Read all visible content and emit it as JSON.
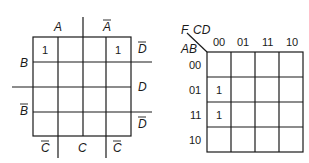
{
  "left_map": {
    "top_labels": [
      "A",
      "A"
    ],
    "top_labels_overbar": [
      false,
      true
    ],
    "right_labels": [
      "D",
      "D",
      "D"
    ],
    "right_labels_overbar": [
      true,
      false,
      true
    ],
    "left_labels": [
      "B",
      "B"
    ],
    "left_labels_overbar": [
      false,
      true
    ],
    "bottom_labels": [
      "C",
      "C",
      "C"
    ],
    "bottom_labels_overbar": [
      true,
      false,
      true
    ],
    "cells": [
      [
        "1",
        "",
        "",
        "1"
      ],
      [
        "",
        "",
        "",
        ""
      ],
      [
        "",
        "",
        "",
        ""
      ],
      [
        "",
        "",
        "",
        ""
      ]
    ]
  },
  "right_map": {
    "corner_output": "F",
    "corner_cols": "CD",
    "corner_rows": "AB",
    "col_headers": [
      "00",
      "01",
      "11",
      "10"
    ],
    "row_headers": [
      "00",
      "01",
      "11",
      "10"
    ],
    "cells": [
      [
        "",
        "",
        "",
        ""
      ],
      [
        "1",
        "",
        "",
        ""
      ],
      [
        "1",
        "",
        "",
        ""
      ],
      [
        "",
        "",
        "",
        ""
      ]
    ]
  }
}
